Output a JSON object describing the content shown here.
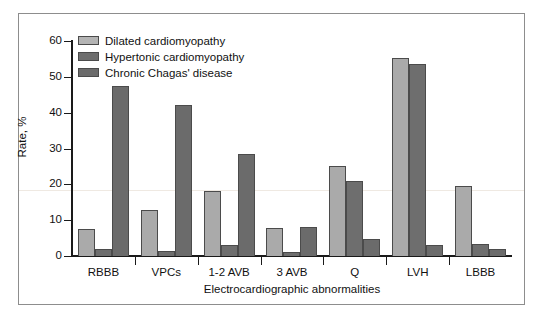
{
  "chart_data": {
    "type": "bar",
    "title": "",
    "xlabel": "Electrocardiographic abnormalities",
    "ylabel": "Rate, %",
    "ylim": [
      0,
      60
    ],
    "yticks": [
      0,
      10,
      20,
      30,
      40,
      50,
      60
    ],
    "grid": false,
    "legend_position": "top-left",
    "categories": [
      "RBBB",
      "VPCs",
      "1-2 AVB",
      "3 AVB",
      "Q",
      "LVH",
      "LBBB"
    ],
    "series": [
      {
        "name": "Dilated cardiomyopathy",
        "color": "#aaaaaa",
        "values": [
          7.6,
          12.8,
          18.2,
          7.8,
          25.0,
          55.2,
          19.5
        ]
      },
      {
        "name": "Hypertonic cardiomyopathy",
        "color": "#6e6e6e",
        "values": [
          2.0,
          1.3,
          3.0,
          1.0,
          20.9,
          53.5,
          3.4
        ]
      },
      {
        "name": "Chronic Chagas' disease",
        "color": "#6b6b6b",
        "values": [
          47.5,
          42.2,
          28.4,
          8.0,
          4.8,
          3.1,
          2.0
        ]
      }
    ]
  },
  "axis": {
    "y_title": "Rate, %",
    "x_title": "Electrocardiographic abnormalities",
    "y_tick_labels": [
      "0",
      "10",
      "20",
      "30",
      "40",
      "50",
      "60"
    ],
    "x_tick_labels": [
      "RBBB",
      "VPCs",
      "1-2 AVB",
      "3 AVB",
      "Q",
      "LVH",
      "LBBB"
    ]
  },
  "legend": {
    "items": [
      {
        "label": "Dilated cardiomyopathy"
      },
      {
        "label": "Hypertonic cardiomyopathy"
      },
      {
        "label": "Chronic Chagas' disease"
      }
    ]
  }
}
